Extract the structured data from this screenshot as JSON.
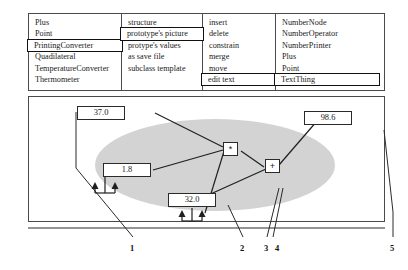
{
  "menu": {
    "columns": [
      {
        "name": "class-list",
        "items": [
          {
            "label": "Plus",
            "selected": false
          },
          {
            "label": "Point",
            "selected": false
          },
          {
            "label": "PrintingConverter",
            "selected": true
          },
          {
            "label": "Quadilateral",
            "selected": false
          },
          {
            "label": "TemperatureConverter",
            "selected": false
          },
          {
            "label": "Thermometer",
            "selected": false
          }
        ]
      },
      {
        "name": "view-list",
        "items": [
          {
            "label": "structure",
            "selected": false
          },
          {
            "label": "prototype's picture",
            "selected": true
          },
          {
            "label": "protype's values",
            "selected": false
          },
          {
            "label": "as save file",
            "selected": false
          },
          {
            "label": "subclass template",
            "selected": false
          }
        ]
      },
      {
        "name": "action-list",
        "items": [
          {
            "label": "insert",
            "selected": false
          },
          {
            "label": "delete",
            "selected": false
          },
          {
            "label": "constrain",
            "selected": false
          },
          {
            "label": "merge",
            "selected": false
          },
          {
            "label": "move",
            "selected": false
          },
          {
            "label": "edit text",
            "selected": true
          }
        ]
      },
      {
        "name": "type-list",
        "items": [
          {
            "label": "NumberNode",
            "selected": false
          },
          {
            "label": "NumberOperator",
            "selected": false
          },
          {
            "label": "NumberPrinter",
            "selected": false
          },
          {
            "label": "Plus",
            "selected": false
          },
          {
            "label": "Point",
            "selected": false
          },
          {
            "label": "TextThing",
            "selected": true
          }
        ]
      }
    ]
  },
  "diagram": {
    "nodes": [
      {
        "name": "node-37",
        "label": "37.0"
      },
      {
        "name": "node-1-8",
        "label": "1.8"
      },
      {
        "name": "node-multiply",
        "label": "*"
      },
      {
        "name": "node-32",
        "label": "32.0"
      },
      {
        "name": "node-plus",
        "label": "+"
      },
      {
        "name": "node-98-6",
        "label": "98.6"
      }
    ]
  },
  "callouts": [
    {
      "name": "callout-1",
      "label": "1"
    },
    {
      "name": "callout-2",
      "label": "2"
    },
    {
      "name": "callout-3",
      "label": "3"
    },
    {
      "name": "callout-4",
      "label": "4"
    },
    {
      "name": "callout-5",
      "label": "5"
    }
  ],
  "colors": {
    "ellipse_fill": "#d3d3d3",
    "border": "#4a4a4a",
    "selection_outline": "#111111",
    "background": "#ffffff"
  }
}
